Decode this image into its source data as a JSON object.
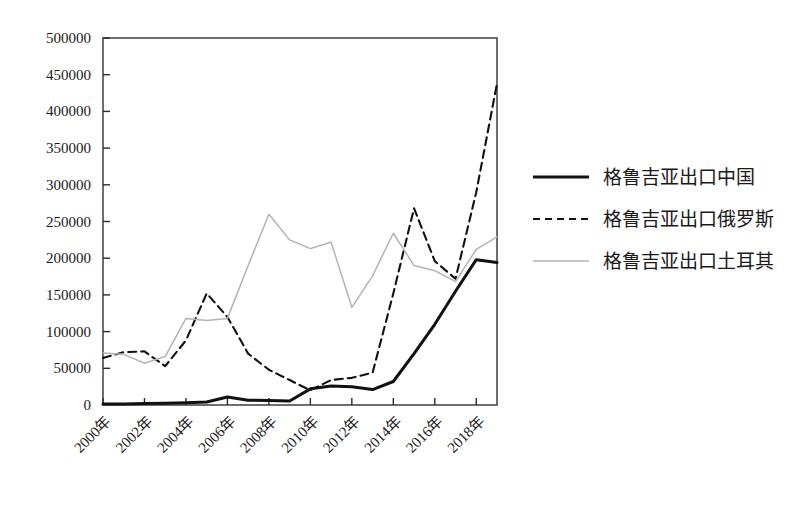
{
  "chart_data": {
    "type": "line",
    "title": "",
    "xlabel": "",
    "ylabel": "",
    "grid": false,
    "legend_position": "right",
    "x": [
      2000,
      2001,
      2002,
      2003,
      2004,
      2005,
      2006,
      2007,
      2008,
      2009,
      2010,
      2011,
      2012,
      2013,
      2014,
      2015,
      2016,
      2017,
      2018,
      2019
    ],
    "xlim": [
      2000,
      2019
    ],
    "ylim": [
      0,
      500000
    ],
    "ytick_values": [
      0,
      50000,
      100000,
      150000,
      200000,
      250000,
      300000,
      350000,
      400000,
      450000,
      500000
    ],
    "ytick_labels": [
      "0",
      "50000",
      "100000",
      "150000",
      "200000",
      "250000",
      "300000",
      "350000",
      "400000",
      "450000",
      "500000"
    ],
    "xtick_values": [
      2000,
      2002,
      2004,
      2006,
      2008,
      2010,
      2012,
      2014,
      2016,
      2018
    ],
    "xtick_labels": [
      "2000年",
      "2002年",
      "2004年",
      "2006年",
      "2008年",
      "2010年",
      "2012年",
      "2014年",
      "2016年",
      "2018年"
    ],
    "series": [
      {
        "name": "格鲁吉亚出口中国",
        "style": "solid-thick",
        "color": "#111111",
        "values": [
          1500,
          1500,
          2000,
          2500,
          3000,
          4000,
          11000,
          6500,
          6000,
          5500,
          22000,
          26000,
          25000,
          21000,
          32000,
          70000,
          110000,
          155000,
          198000,
          194000
        ]
      },
      {
        "name": "格鲁吉亚出口俄罗斯",
        "style": "dashed",
        "color": "#111111",
        "values": [
          64000,
          72000,
          73000,
          53000,
          88000,
          152000,
          120000,
          70000,
          48000,
          34000,
          20000,
          34000,
          37000,
          44000,
          152000,
          268000,
          196000,
          172000,
          290000,
          438000
        ]
      },
      {
        "name": "格鲁吉亚出口土耳其",
        "style": "solid-thin",
        "color": "#b3b3b3",
        "values": [
          71000,
          69000,
          57000,
          66000,
          118000,
          115000,
          118000,
          190000,
          260000,
          225000,
          213000,
          222000,
          133000,
          176000,
          234000,
          190000,
          183000,
          168000,
          212000,
          229000
        ]
      }
    ]
  },
  "legend": {
    "items": [
      {
        "label": "格鲁吉亚出口中国"
      },
      {
        "label": "格鲁吉亚出口俄罗斯"
      },
      {
        "label": "格鲁吉亚出口土耳其"
      }
    ]
  }
}
